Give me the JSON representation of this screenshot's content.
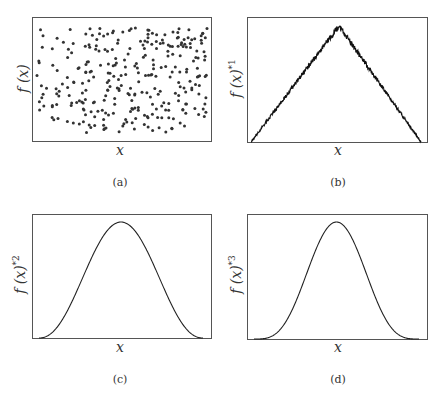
{
  "figure": {
    "panels": [
      {
        "id": "a",
        "caption": "(a)",
        "xlabel": "x",
        "ylabel_base": "f (x)",
        "ylabel_power": ""
      },
      {
        "id": "b",
        "caption": "(b)",
        "xlabel": "x",
        "ylabel_base": "f (x)",
        "ylabel_power": "*1"
      },
      {
        "id": "c",
        "caption": "(c)",
        "xlabel": "x",
        "ylabel_base": "f (x)",
        "ylabel_power": "*2"
      },
      {
        "id": "d",
        "caption": "(d)",
        "xlabel": "x",
        "ylabel_base": "f (x)",
        "ylabel_power": "*3"
      }
    ]
  },
  "chart_data": [
    {
      "panel": "a",
      "type": "scatter",
      "title": "",
      "xlabel": "x",
      "ylabel": "f(x)",
      "description": "Uniform random scatter of ~300 points filling the plot area",
      "n_points": 300,
      "xlim": [
        0,
        1
      ],
      "ylim": [
        0,
        1
      ],
      "grid": false,
      "ticks": false
    },
    {
      "panel": "b",
      "type": "line",
      "title": "",
      "xlabel": "x",
      "ylabel": "f(x)*1",
      "description": "Noisy triangular distribution rising linearly from left edge to a peak at center, then falling linearly to right edge",
      "x": [
        0,
        0.25,
        0.5,
        0.75,
        1
      ],
      "y": [
        0,
        0.47,
        0.94,
        0.47,
        0
      ],
      "xlim": [
        0,
        1
      ],
      "ylim": [
        0,
        1
      ],
      "grid": false,
      "ticks": false
    },
    {
      "panel": "c",
      "type": "line",
      "title": "",
      "xlabel": "x",
      "ylabel": "f(x)*2",
      "description": "Smooth bell-shaped curve (convolution power 2), peak at center",
      "x": [
        0,
        0.1,
        0.2,
        0.3,
        0.4,
        0.5,
        0.6,
        0.7,
        0.8,
        0.9,
        1
      ],
      "y": [
        0,
        0.04,
        0.17,
        0.42,
        0.79,
        0.94,
        0.79,
        0.42,
        0.17,
        0.04,
        0
      ],
      "xlim": [
        0,
        1
      ],
      "ylim": [
        0,
        1
      ],
      "grid": false,
      "ticks": false
    },
    {
      "panel": "d",
      "type": "line",
      "title": "",
      "xlabel": "x",
      "ylabel": "f(x)*3",
      "description": "Narrower smooth bell-shaped curve (convolution power 3), peak at center",
      "x": [
        0,
        0.1,
        0.2,
        0.3,
        0.4,
        0.5,
        0.6,
        0.7,
        0.8,
        0.9,
        1
      ],
      "y": [
        0,
        0.01,
        0.07,
        0.3,
        0.74,
        0.94,
        0.74,
        0.3,
        0.07,
        0.01,
        0
      ],
      "xlim": [
        0,
        1
      ],
      "ylim": [
        0,
        1
      ],
      "grid": false,
      "ticks": false
    }
  ]
}
